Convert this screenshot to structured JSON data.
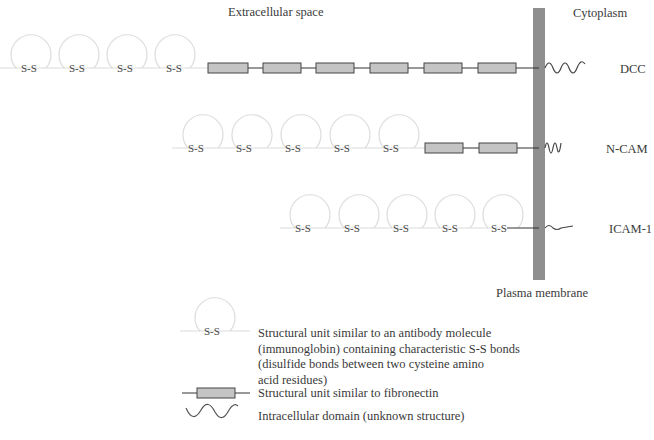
{
  "regions": {
    "extracellular": "Extracellular space",
    "cytoplasm": "Cytoplasm",
    "membrane": "Plasma membrane"
  },
  "molecules": [
    {
      "name": "DCC",
      "ig_domains": 4,
      "fibronectin_units": 6,
      "intracellular": "long wavy"
    },
    {
      "name": "N-CAM",
      "ig_domains": 5,
      "fibronectin_units": 2,
      "intracellular": "short wavy"
    },
    {
      "name": "ICAM-1",
      "ig_domains": 5,
      "fibronectin_units": 0,
      "intracellular": "small tail"
    }
  ],
  "ss_label": "S-S",
  "legend": {
    "ig_text": "Structural unit similar to an antibody molecule (immunoglobin) containing characteristic S-S bonds (disulfide bonds between two cysteine amino acid residues)",
    "ig_lines": [
      "Structural unit similar to an antibody molecule",
      "(immunoglobin) containing characteristic S-S bonds",
      "(disulfide bonds between two cysteine amino",
      "acid residues)"
    ],
    "fn_text": "Structural unit similar to fibronectin",
    "intra_text": "Intracellular domain (unknown structure)"
  },
  "colors": {
    "membrane": "#8f8f8f",
    "fn_box": "#c4c4c4",
    "loop": "#dcdcdc",
    "line": "#333333"
  }
}
